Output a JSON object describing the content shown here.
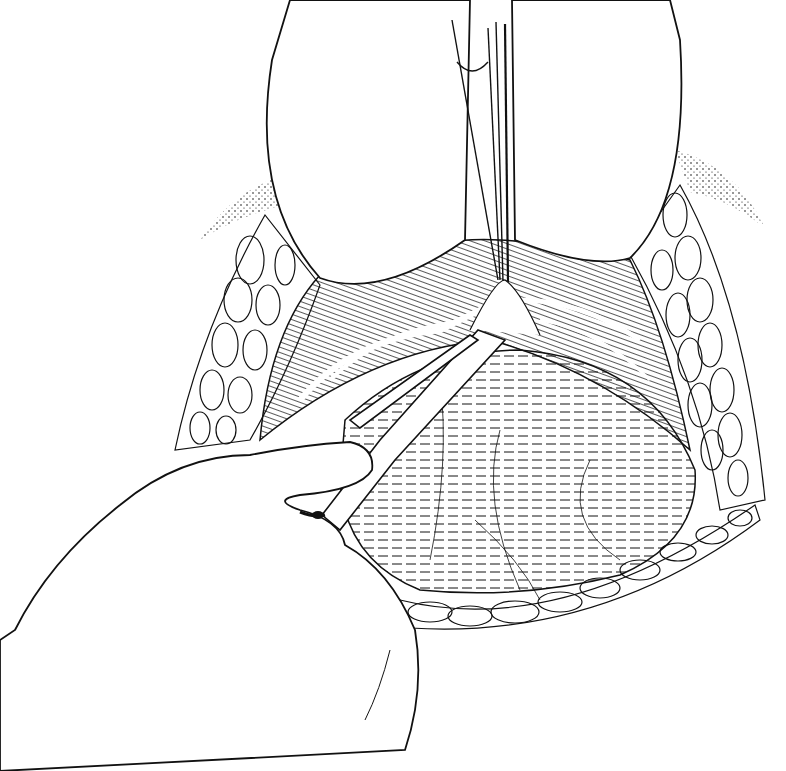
{
  "illustration": {
    "kind": "surgical line drawing",
    "style": "black ink on white",
    "colors": {
      "ink": "#111111",
      "paper": "#ffffff"
    },
    "subjects": [
      "retractor-blade-left",
      "retractor-blade-right",
      "forceps-upper",
      "surgical-scissors",
      "gloved-hand",
      "exposed-organ-dome",
      "fat-tissue-left",
      "fat-tissue-right",
      "fat-tissue-bottom",
      "peritoneal-tissue-fold"
    ]
  }
}
